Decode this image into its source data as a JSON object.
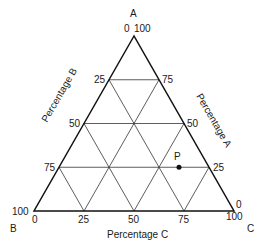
{
  "diagram": {
    "type": "ternary",
    "vertices": {
      "A": {
        "label": "A",
        "x": 134,
        "y": 36
      },
      "B": {
        "label": "B",
        "x": 34,
        "y": 211
      },
      "C": {
        "label": "C",
        "x": 234,
        "y": 211
      }
    },
    "vertex_labels": {
      "A": "A",
      "B": "B",
      "C": "C"
    },
    "axis_titles": {
      "A": "Percentage A",
      "B": "Percentage B",
      "C": "Percentage C"
    },
    "corner_ticks": {
      "top_left": "0",
      "top_right": "100",
      "bottom_left_outer": "100",
      "bottom_left_inner": "0",
      "bottom_right_top": "0",
      "bottom_right_bottom": "100"
    },
    "left_ticks": [
      "25",
      "50",
      "75"
    ],
    "right_ticks": [
      "75",
      "50",
      "25"
    ],
    "bottom_ticks": [
      "25",
      "50",
      "75"
    ],
    "grid_step": 25,
    "point": {
      "label": "P",
      "A": 25,
      "B": 15,
      "C": 60
    }
  }
}
